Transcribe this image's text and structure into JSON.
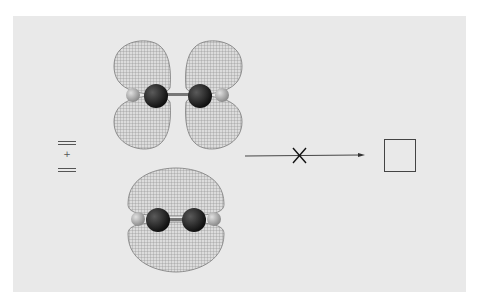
{
  "figure": {
    "reactant_notation": {
      "top_symbol": "=",
      "operator": "+",
      "bottom_symbol": "="
    },
    "molecules": [
      {
        "name": "acetylene-top",
        "orbital": "p-orbital lobes (four-lobed, nodal)",
        "atoms": [
          "H",
          "C",
          "C",
          "H"
        ]
      },
      {
        "name": "acetylene-bottom",
        "orbital": "pi bonding orbital (two-lobed)",
        "atoms": [
          "H",
          "C",
          "C",
          "H"
        ]
      }
    ],
    "reaction_arrow": {
      "crossed_out": true,
      "meaning": "reaction forbidden"
    },
    "product": {
      "shape": "square",
      "label": "cyclobutadiene"
    },
    "colors": {
      "panel_bg": "#e9e9e9",
      "mesh": "#8a8a8a",
      "carbon": "#1e1e1e",
      "hydrogen": "#b9b9b9",
      "line": "#333333"
    }
  }
}
